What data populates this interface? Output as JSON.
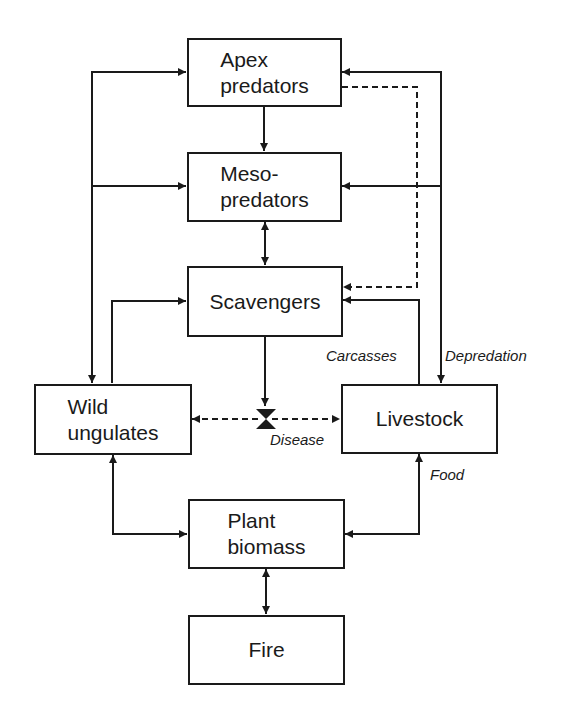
{
  "diagram": {
    "nodes": [
      {
        "id": "apex",
        "label": "Apex\npredators"
      },
      {
        "id": "meso",
        "label": "Meso-\npredators"
      },
      {
        "id": "scavengers",
        "label": "Scavengers"
      },
      {
        "id": "wild",
        "label": "Wild\nungulates"
      },
      {
        "id": "livestock",
        "label": "Livestock"
      },
      {
        "id": "plant",
        "label": "Plant\nbiomass"
      },
      {
        "id": "fire",
        "label": "Fire"
      }
    ],
    "edge_labels": {
      "carcasses": "Carcasses",
      "depredation": "Depredation",
      "disease": "Disease",
      "food": "Food"
    },
    "edges": [
      {
        "from": "apex",
        "to": "meso",
        "style": "solid"
      },
      {
        "from": "meso",
        "to": "scavengers",
        "style": "solid",
        "bidirectional": true
      },
      {
        "from": "apex",
        "to": "scavengers",
        "style": "dashed"
      },
      {
        "from": "wild",
        "to": "apex",
        "style": "solid",
        "bidirectional": true
      },
      {
        "from": "wild",
        "to": "meso",
        "style": "solid"
      },
      {
        "from": "wild",
        "to": "scavengers",
        "style": "solid"
      },
      {
        "from": "livestock",
        "to": "apex",
        "style": "solid",
        "bidirectional": true,
        "label": "Depredation"
      },
      {
        "from": "livestock",
        "to": "meso",
        "style": "solid"
      },
      {
        "from": "livestock",
        "to": "scavengers",
        "style": "solid",
        "label": "Carcasses"
      },
      {
        "from": "scavengers",
        "to": "disease",
        "style": "solid"
      },
      {
        "from": "wild",
        "to": "livestock",
        "style": "dashed",
        "bidirectional": true,
        "label": "Disease"
      },
      {
        "from": "plant",
        "to": "wild",
        "style": "solid",
        "bidirectional": true
      },
      {
        "from": "plant",
        "to": "livestock",
        "style": "solid",
        "bidirectional": true,
        "label": "Food"
      },
      {
        "from": "plant",
        "to": "fire",
        "style": "solid",
        "bidirectional": true
      }
    ],
    "colors": {
      "line": "#1a1a1a",
      "background": "#ffffff"
    }
  }
}
